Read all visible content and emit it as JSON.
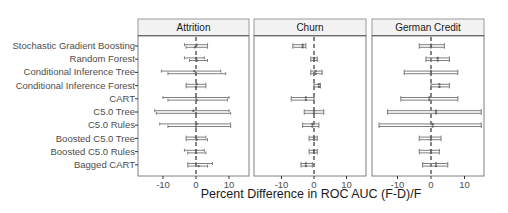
{
  "chart_data": {
    "type": "forest-errorbar",
    "title": "",
    "xlabel": "Percent Difference in ROC AUC (F-D)/F",
    "ylabel": "",
    "xlim": [
      -16,
      16
    ],
    "xticks": [
      -10,
      0,
      10
    ],
    "reference_line": 0,
    "grid": false,
    "facets": [
      "Attrition",
      "Churn",
      "German Credit"
    ],
    "categories": [
      "Stochastic Gradient Boosting",
      "Random Forest",
      "Conditional Inference Tree",
      "Conditional Inference Forest",
      "CART",
      "C5.0 Tree",
      "C5.0 Rules",
      "Boosted C5.0 Tree",
      "Boosted C5.0 Rules",
      "Bagged CART"
    ],
    "series": [
      {
        "name": "Attrition",
        "intervals": [
          {
            "est_a": 0.2,
            "lo_a": -3.5,
            "hi_a": 3.5,
            "est_b": -0.3,
            "lo_b": -3.0,
            "hi_b": 3.5
          },
          {
            "est_a": 0.0,
            "lo_a": -3.5,
            "hi_a": 2.5,
            "est_b": 0.3,
            "lo_b": -2.0,
            "hi_b": 3.5
          },
          {
            "est_a": -0.5,
            "lo_a": -10.5,
            "hi_a": 7.5,
            "est_b": 0.0,
            "lo_b": -8.5,
            "hi_b": 9.0
          },
          {
            "est_a": 0.2,
            "lo_a": -3.0,
            "hi_a": 3.0,
            "est_b": 0.0,
            "lo_b": -3.0,
            "hi_b": 3.0
          },
          {
            "est_a": 0.0,
            "lo_a": -10.0,
            "hi_a": 10.0,
            "est_b": 0.2,
            "lo_b": -8.5,
            "hi_b": 9.5
          },
          {
            "est_a": -0.8,
            "lo_a": -12.5,
            "hi_a": 10.0,
            "est_b": 0.0,
            "lo_b": -12.0,
            "hi_b": 10.5
          },
          {
            "est_a": 0.2,
            "lo_a": -11.0,
            "hi_a": 10.5,
            "est_b": 0.0,
            "lo_b": -8.5,
            "hi_b": 10.5
          },
          {
            "est_a": 0.0,
            "lo_a": -3.0,
            "hi_a": 3.0,
            "est_b": 0.2,
            "lo_b": -3.0,
            "hi_b": 3.5
          },
          {
            "est_a": 0.0,
            "lo_a": -3.5,
            "hi_a": 2.5,
            "est_b": 0.0,
            "lo_b": -2.5,
            "hi_b": 3.0
          },
          {
            "est_a": 0.0,
            "lo_a": -2.5,
            "hi_a": 5.0,
            "est_b": 0.8,
            "lo_b": -2.5,
            "hi_b": 3.5
          }
        ]
      },
      {
        "name": "Churn",
        "intervals": [
          {
            "est_a": -3.5,
            "lo_a": -6.5,
            "hi_a": -2.5,
            "est_b": -3.5,
            "lo_b": -6.5,
            "hi_b": -2.5
          },
          {
            "est_a": 0.0,
            "lo_a": -1.0,
            "hi_a": 1.0,
            "est_b": 0.0,
            "lo_b": -1.0,
            "hi_b": 1.0
          },
          {
            "est_a": 0.5,
            "lo_a": -1.0,
            "hi_a": 2.5,
            "est_b": 0.5,
            "lo_b": -1.0,
            "hi_b": 2.5
          },
          {
            "est_a": 1.5,
            "lo_a": 0.0,
            "hi_a": 2.0,
            "est_b": 1.5,
            "lo_b": 0.0,
            "hi_b": 2.0
          },
          {
            "est_a": -2.5,
            "lo_a": -7.0,
            "hi_a": 0.0,
            "est_b": -2.5,
            "lo_b": -7.0,
            "hi_b": 0.0
          },
          {
            "est_a": 0.0,
            "lo_a": -3.0,
            "hi_a": 3.0,
            "est_b": 0.0,
            "lo_b": -3.0,
            "hi_b": 3.0
          },
          {
            "est_a": -0.5,
            "lo_a": -3.5,
            "hi_a": 1.5,
            "est_b": -0.5,
            "lo_b": -3.5,
            "hi_b": 1.5
          },
          {
            "est_a": 0.0,
            "lo_a": -1.5,
            "hi_a": 1.0,
            "est_b": 0.0,
            "lo_b": -1.5,
            "hi_b": 1.0
          },
          {
            "est_a": 0.0,
            "lo_a": -1.5,
            "hi_a": 1.0,
            "est_b": 0.0,
            "lo_b": -1.5,
            "hi_b": 1.0
          },
          {
            "est_a": -2.5,
            "lo_a": -4.0,
            "hi_a": -0.5,
            "est_b": -2.5,
            "lo_b": -4.0,
            "hi_b": -0.5
          }
        ]
      },
      {
        "name": "German Credit",
        "intervals": [
          {
            "est_a": 0.0,
            "lo_a": -3.5,
            "hi_a": 4.0,
            "est_b": 0.0,
            "lo_b": -3.5,
            "hi_b": 4.0
          },
          {
            "est_a": 2.0,
            "lo_a": -1.5,
            "hi_a": 5.5,
            "est_b": 2.0,
            "lo_b": -1.5,
            "hi_b": 5.5
          },
          {
            "est_a": 0.0,
            "lo_a": -8.0,
            "hi_a": 8.0,
            "est_b": 0.0,
            "lo_b": -8.0,
            "hi_b": 8.0
          },
          {
            "est_a": 2.5,
            "lo_a": 0.0,
            "hi_a": 5.5,
            "est_b": 2.5,
            "lo_b": 0.0,
            "hi_b": 5.5
          },
          {
            "est_a": -0.5,
            "lo_a": -9.0,
            "hi_a": 8.0,
            "est_b": -0.5,
            "lo_b": -9.0,
            "hi_b": 8.0
          },
          {
            "est_a": 1.5,
            "lo_a": -13.0,
            "hi_a": 15.0,
            "est_b": 1.5,
            "lo_b": -13.0,
            "hi_b": 15.0
          },
          {
            "est_a": 0.5,
            "lo_a": -15.5,
            "hi_a": 15.0,
            "est_b": 0.5,
            "lo_b": -15.5,
            "hi_b": 15.0
          },
          {
            "est_a": 0.0,
            "lo_a": -3.5,
            "hi_a": 3.0,
            "est_b": 0.0,
            "lo_b": -3.5,
            "hi_b": 3.0
          },
          {
            "est_a": 0.0,
            "lo_a": -3.5,
            "hi_a": 2.5,
            "est_b": 0.0,
            "lo_b": -3.5,
            "hi_b": 2.5
          },
          {
            "est_a": 1.5,
            "lo_a": -2.5,
            "hi_a": 5.0,
            "est_b": 1.5,
            "lo_b": -2.5,
            "hi_b": 5.0
          }
        ]
      }
    ],
    "colors": {
      "strip_fill": "#f2f2f2",
      "strip_border": "#333333",
      "panel_border": "#808080",
      "bar": "#7f7f7f",
      "reference": "#333333",
      "text": "#4d4d4d"
    }
  },
  "labels": {
    "xtitle": "Percent Difference in ROC AUC (F-D)/F",
    "rows": [
      "Stochastic Gradient Boosting",
      "Random Forest",
      "Conditional Inference Tree",
      "Conditional Inference Forest",
      "CART",
      "C5.0 Tree",
      "C5.0 Rules",
      "Boosted C5.0 Tree",
      "Boosted C5.0 Rules",
      "Bagged CART"
    ],
    "facets": [
      "Attrition",
      "Churn",
      "German Credit"
    ],
    "ticks": [
      "-10",
      "0",
      "10"
    ]
  }
}
